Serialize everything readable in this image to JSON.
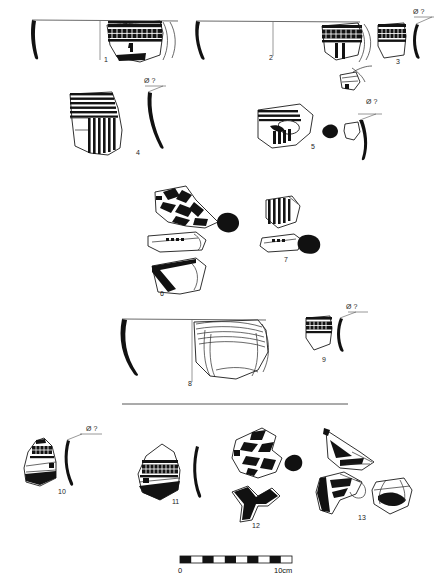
{
  "plate": {
    "title": "Ceramic vessel profiles and decorated sherds",
    "background_color": "#ffffff",
    "ink_color": "#111111",
    "width_px": 438,
    "height_px": 588
  },
  "diameter_annotation": {
    "symbol": "Ø",
    "value": "?",
    "label": "Ø ?"
  },
  "scale_bar": {
    "start_label": "0",
    "end_label": "10cm",
    "segments": 10,
    "segment_colors": [
      "#111111",
      "#ffffff"
    ],
    "x_start_px": 180,
    "x_end_px": 292
  },
  "catalogue": [
    {
      "number": "1",
      "type": "bowl-profile-with-decorated-body",
      "has_diameter_label": false,
      "description": "Open bowl, solid black section at left, rim line across, body sherd with checkerboard band and vertical handle stub"
    },
    {
      "number": "2",
      "type": "bowl-profile",
      "has_diameter_label": false,
      "description": "Wide open bowl, solid black section at left, long rim line with central axis, decorated sherd at right with grid band"
    },
    {
      "number": "3",
      "type": "rim-sherd-with-profile",
      "has_diameter_label": true,
      "description": "Rim sherd with checkerboard band and separate black rim profile"
    },
    {
      "number": "4",
      "type": "body-sherd-with-profile",
      "has_diameter_label": true,
      "description": "Sherd with horizontal stripe band over vertical stripe panel, curved black profile at right"
    },
    {
      "number": "5",
      "type": "body-sherd-with-rim-profile",
      "has_diameter_label": true,
      "description": "Sherd with horizontal bands, oval motif and short vertical strokes; separate rim profile with black blob"
    },
    {
      "number": "6",
      "type": "decorated-sherd-group",
      "has_diameter_label": false,
      "description": "Chevron / zigzag decorated sherd, horizontal strip fragment, and base-foot profile"
    },
    {
      "number": "7",
      "type": "sherd-and-handle-section",
      "has_diameter_label": false,
      "description": "Sherd with vertical hatching and horizontal fragment with solid black handle section"
    },
    {
      "number": "8",
      "type": "large-bowl-profile",
      "has_diameter_label": false,
      "description": "Large open bowl, black section at left, horizontal band decoration on right half"
    },
    {
      "number": "9",
      "type": "rim-sherd-with-profile",
      "has_diameter_label": true,
      "description": "Small rim sherd with checkerboard band and black rim profile"
    },
    {
      "number": "10",
      "type": "rim-sherd-with-profile",
      "has_diameter_label": true,
      "description": "Conical rim sherd with grid band and horizontal line, black profile at right"
    },
    {
      "number": "11",
      "type": "rim-sherd-with-profile",
      "has_diameter_label": false,
      "description": "Rim sherd with dense grid band over dark lower body, separate black profile"
    },
    {
      "number": "12",
      "type": "decorated-sherd-group",
      "has_diameter_label": false,
      "description": "Zigzag decorated sherd with black blob, and solid black forked base fragment"
    },
    {
      "number": "13",
      "type": "decorated-sherd-group",
      "has_diameter_label": false,
      "description": "Triangular sherd with filled motifs, black-edged sherd and rounded sherd with curved band"
    }
  ]
}
